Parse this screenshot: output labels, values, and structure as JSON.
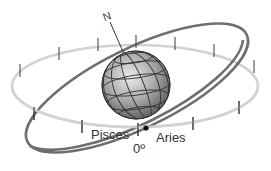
{
  "diagram": {
    "type": "celestial-sphere",
    "labels": {
      "north": "N",
      "pisces": "Pisces",
      "aries": "Aries",
      "zero_degree": "0º"
    },
    "colors": {
      "equator": "#d0d0d0",
      "ecliptic": "#6e6e6e",
      "globe_light": "#e8e8e8",
      "globe_dark": "#6a6a6a",
      "grid": "#3a3a3a",
      "ticks": "#333333",
      "point": "#111111"
    }
  }
}
